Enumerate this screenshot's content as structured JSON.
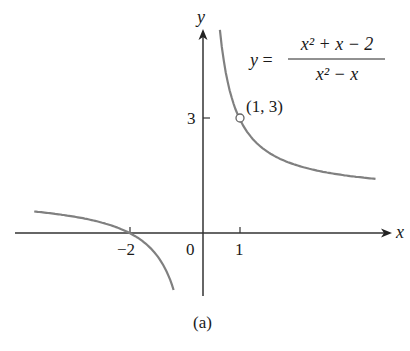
{
  "chart_data": {
    "type": "line",
    "title": "",
    "equation": {
      "lhs": "y",
      "numerator": "x² + x − 2",
      "denominator": "x² − x"
    },
    "xlabel": "x",
    "ylabel": "y",
    "x_ticks": [
      {
        "value": -2,
        "label": "−2"
      },
      {
        "value": 0,
        "label": "0"
      },
      {
        "value": 1,
        "label": "1"
      }
    ],
    "y_ticks": [
      {
        "value": 3,
        "label": "3"
      }
    ],
    "annotations": [
      {
        "x": 1,
        "y": 3,
        "label": "(1, 3)",
        "marker": "open-circle"
      }
    ],
    "series": [
      {
        "name": "left branch",
        "x": [
          -4.6,
          -4,
          -3,
          -2,
          -1.5,
          -1,
          -0.8
        ],
        "y": [
          0.57,
          0.5,
          0.33,
          0,
          -0.33,
          -1,
          -1.5
        ]
      },
      {
        "name": "right branch",
        "x": [
          0.45,
          0.6,
          0.8,
          1,
          1.5,
          2,
          3,
          4.7
        ],
        "y": [
          5.4,
          4.33,
          3.5,
          3,
          2.33,
          2,
          1.67,
          1.43
        ]
      }
    ],
    "xlim": [
      -5.5,
      5.4
    ],
    "ylim": [
      -1.9,
      6.1
    ],
    "grid": false,
    "caption": "(a)"
  }
}
